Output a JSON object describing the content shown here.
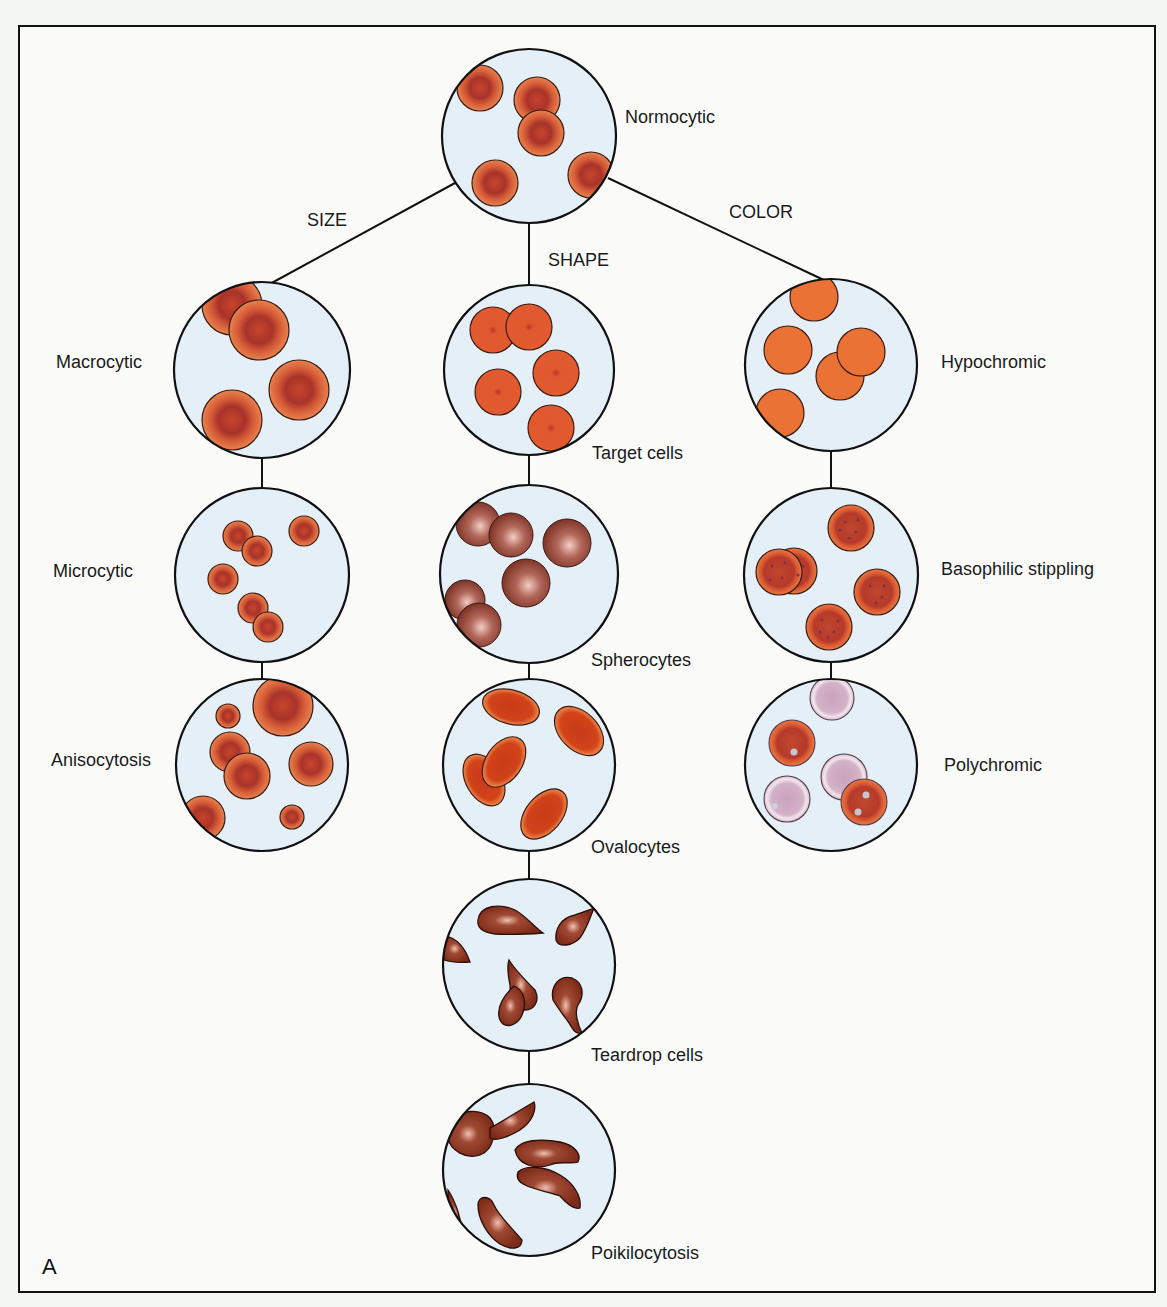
{
  "figure": {
    "panel_letter": "A",
    "colors": {
      "field_bg": "#e4eff8",
      "outline": "#111111",
      "normal_rbc_rim": "#e0703f",
      "normal_rbc_center": "#b2382a",
      "hypochromic": "#ea7235",
      "spherocyte": "#9a4a3e",
      "ovalocyte": "#d2461e",
      "teardrop": "#8e2f1c",
      "polychromic": "#d9bdd2"
    }
  },
  "root": {
    "label": "Normocytic"
  },
  "branches": {
    "size": "SIZE",
    "shape": "SHAPE",
    "color": "COLOR"
  },
  "size_column": [
    {
      "label": "Macrocytic"
    },
    {
      "label": "Microcytic"
    },
    {
      "label": "Anisocytosis"
    }
  ],
  "shape_column": [
    {
      "label": "Target cells"
    },
    {
      "label": "Spherocytes"
    },
    {
      "label": "Ovalocytes"
    },
    {
      "label": "Teardrop cells"
    },
    {
      "label": "Poikilocytosis"
    }
  ],
  "color_column": [
    {
      "label": "Hypochromic"
    },
    {
      "label": "Basophilic stippling"
    },
    {
      "label": "Polychromic"
    }
  ]
}
